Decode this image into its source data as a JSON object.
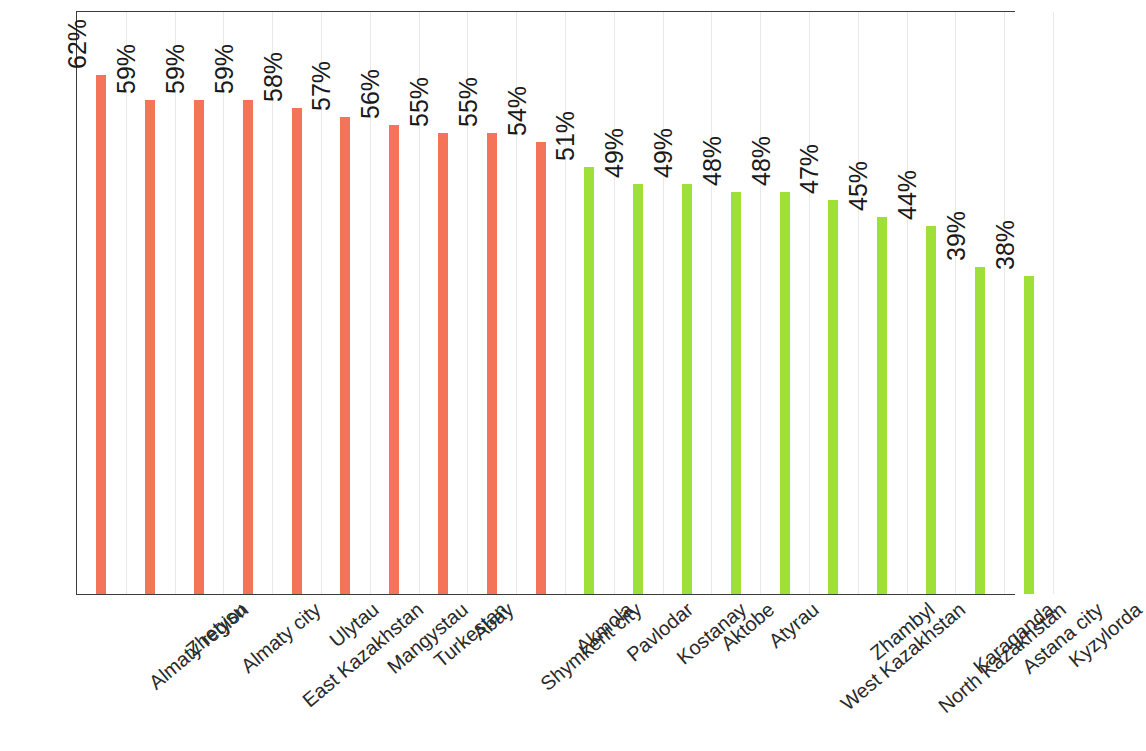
{
  "chart_data": {
    "type": "bar",
    "title": "",
    "subtitle": "",
    "xlabel": "",
    "ylabel": "",
    "grid": true,
    "legend": "none",
    "ylim": [
      0,
      70
    ],
    "value_suffix": "%",
    "categories": [
      "Almaty region",
      "Zhetysu",
      "Almaty city",
      "East Kazakhstan",
      "Ulytau",
      "Mangystau",
      "Turkestan",
      "Abay",
      "Shymkent city",
      "Akmola",
      "Pavlodar",
      "Kostanay",
      "Aktobe",
      "Atyrau",
      "West Kazakhstan",
      "Zhambyl",
      "North Kazakhstan",
      "Karaganda",
      "Astana city",
      "Kyzylorda"
    ],
    "values": [
      62,
      59,
      59,
      59,
      58,
      57,
      56,
      55,
      55,
      54,
      51,
      49,
      49,
      48,
      48,
      47,
      45,
      44,
      39,
      38
    ],
    "data_labels": [
      "62%",
      "59%",
      "59%",
      "59%",
      "58%",
      "57%",
      "56%",
      "55%",
      "55%",
      "54%",
      "51%",
      "49%",
      "49%",
      "48%",
      "48%",
      "47%",
      "45%",
      "44%",
      "39%",
      "38%"
    ],
    "bar_colors": [
      "#f4745a",
      "#f4745a",
      "#f4745a",
      "#f4745a",
      "#f4745a",
      "#f4745a",
      "#f4745a",
      "#f4745a",
      "#f4745a",
      "#f4745a",
      "#9ee038",
      "#9ee038",
      "#9ee038",
      "#9ee038",
      "#9ee038",
      "#9ee038",
      "#9ee038",
      "#9ee038",
      "#9ee038",
      "#9ee038"
    ],
    "color_groups": [
      {
        "name": "above-median",
        "color": "#f4745a"
      },
      {
        "name": "below-median",
        "color": "#9ee038"
      }
    ],
    "axis_color": "#3c3c3c",
    "gridline_color": "#e9e9e9",
    "background": "#ffffff"
  }
}
